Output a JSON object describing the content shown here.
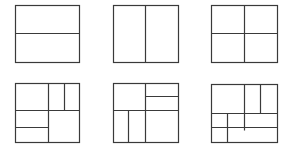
{
  "diagram": {
    "title": "",
    "line_color": "#3a3a3a",
    "background": "#ffffff",
    "layouts": [
      {
        "id": "layout-1",
        "label": "horizontal split into 2",
        "box": {
          "x": 15,
          "y": 5,
          "w": 64,
          "h": 57
        },
        "lines": [
          {
            "x1": 15,
            "y1": 33,
            "x2": 79,
            "y2": 33
          }
        ]
      },
      {
        "id": "layout-2",
        "label": "vertical split into 2",
        "box": {
          "x": 113,
          "y": 5,
          "w": 65,
          "h": 57
        },
        "lines": [
          {
            "x1": 145,
            "y1": 5,
            "x2": 145,
            "y2": 62
          }
        ]
      },
      {
        "id": "layout-3",
        "label": "2x2 quadrants",
        "box": {
          "x": 211,
          "y": 5,
          "w": 66,
          "h": 57
        },
        "lines": [
          {
            "x1": 244,
            "y1": 5,
            "x2": 244,
            "y2": 62
          },
          {
            "x1": 211,
            "y1": 33,
            "x2": 277,
            "y2": 33
          }
        ]
      },
      {
        "id": "layout-4",
        "label": "nested split with top-right and bottom-left subdivisions",
        "box": {
          "x": 15,
          "y": 83,
          "w": 64,
          "h": 59
        },
        "lines": [
          {
            "x1": 48,
            "y1": 83,
            "x2": 48,
            "y2": 142
          },
          {
            "x1": 15,
            "y1": 110,
            "x2": 79,
            "y2": 110
          },
          {
            "x1": 64,
            "y1": 83,
            "x2": 64,
            "y2": 110
          },
          {
            "x1": 15,
            "y1": 127,
            "x2": 48,
            "y2": 127
          }
        ]
      },
      {
        "id": "layout-5",
        "label": "nested split with top-right horizontal and bottom-left vertical subdivisions",
        "box": {
          "x": 113,
          "y": 83,
          "w": 65,
          "h": 59
        },
        "lines": [
          {
            "x1": 145,
            "y1": 83,
            "x2": 145,
            "y2": 142
          },
          {
            "x1": 113,
            "y1": 110,
            "x2": 178,
            "y2": 110
          },
          {
            "x1": 145,
            "y1": 96,
            "x2": 178,
            "y2": 96
          },
          {
            "x1": 128,
            "y1": 110,
            "x2": 128,
            "y2": 142
          }
        ]
      },
      {
        "id": "layout-6",
        "label": "multi-level grid subdivision",
        "box": {
          "x": 211,
          "y": 84,
          "w": 66,
          "h": 58
        },
        "lines": [
          {
            "x1": 244,
            "y1": 84,
            "x2": 244,
            "y2": 130
          },
          {
            "x1": 260,
            "y1": 84,
            "x2": 260,
            "y2": 113
          },
          {
            "x1": 211,
            "y1": 113,
            "x2": 277,
            "y2": 113
          },
          {
            "x1": 211,
            "y1": 127,
            "x2": 277,
            "y2": 127
          },
          {
            "x1": 227,
            "y1": 113,
            "x2": 227,
            "y2": 142
          }
        ]
      }
    ]
  }
}
